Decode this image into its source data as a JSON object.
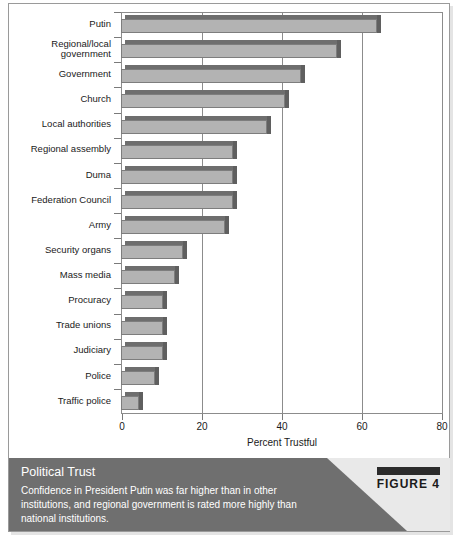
{
  "chart_data": {
    "type": "bar",
    "orientation": "horizontal",
    "title": "",
    "xlabel": "Percent Trustful",
    "ylabel": "",
    "xlim": [
      0,
      80
    ],
    "xticks": [
      0,
      20,
      40,
      60,
      80
    ],
    "grid": true,
    "legend": "none",
    "categories": [
      "Putin",
      "Regional/local\ngovernment",
      "Government",
      "Church",
      "Local authorities",
      "Regional assembly",
      "Duma",
      "Federation Council",
      "Army",
      "Security organs",
      "Mass media",
      "Procuracy",
      "Trade unions",
      "Judiciary",
      "Police",
      "Traffic police"
    ],
    "values": [
      64,
      54,
      45,
      41,
      36.5,
      28,
      28,
      28,
      26,
      15.5,
      13.5,
      10.5,
      10.5,
      10.5,
      8.5,
      4.5
    ]
  },
  "caption": {
    "title": "Political Trust",
    "body": "Confidence in President Putin was far higher than in other institutions, and regional government is rated more highly than national institutions.",
    "figure_label": "FIGURE 4"
  },
  "colors": {
    "bar_face": "#b3b3b3",
    "bar_top": "#6e6e6e",
    "bar_side": "#5f5f5f",
    "caption_band": "#6f6f6f",
    "frame": "#8c8c8c"
  }
}
